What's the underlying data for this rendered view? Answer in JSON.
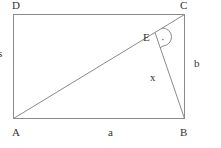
{
  "diagram": {
    "points": {
      "A": "A",
      "B": "B",
      "C": "C",
      "D": "D",
      "E": "E"
    },
    "sides": {
      "a": "a",
      "b": "b",
      "x": "x",
      "left_fragment": "s"
    },
    "right_angle_marker": "·"
  }
}
